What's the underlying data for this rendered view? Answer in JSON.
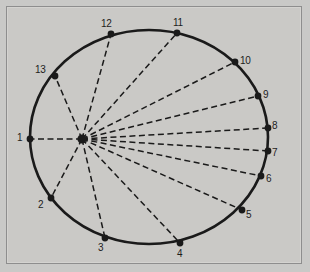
{
  "figure": {
    "type": "circle-spoke-diagram",
    "background_color": "#c9c9c7",
    "panel_color": "#cac9c6",
    "frame_color": "#8e8e8e",
    "stroke_color": "#1a1a1a",
    "circle": {
      "center_x": 149,
      "center_y": 137,
      "radius_x": 119,
      "radius_y": 107,
      "line_width": 2.6
    },
    "hub": {
      "label": "hub",
      "x": 82,
      "y": 139,
      "radius": 4.6
    },
    "spoke_style": {
      "dash": "6,3.5",
      "width": 1.5
    }
  },
  "chart_data": {
    "type": "scatter",
    "title": "",
    "xlabel": "",
    "ylabel": "",
    "grid": false,
    "legend": null,
    "annotations": [],
    "hub": {
      "x": 82,
      "y": 139
    },
    "nodes": [
      {
        "label": "1",
        "x": 30,
        "y": 139,
        "label_x": 17,
        "label_y": 133
      },
      {
        "label": "2",
        "x": 51,
        "y": 198,
        "label_x": 38,
        "label_y": 200
      },
      {
        "label": "3",
        "x": 105,
        "y": 238,
        "label_x": 98,
        "label_y": 243
      },
      {
        "label": "4",
        "x": 180,
        "y": 243,
        "label_x": 177,
        "label_y": 249
      },
      {
        "label": "5",
        "x": 242,
        "y": 210,
        "label_x": 246,
        "label_y": 210
      },
      {
        "label": "6",
        "x": 261,
        "y": 176,
        "label_x": 266,
        "label_y": 174
      },
      {
        "label": "7",
        "x": 268,
        "y": 151,
        "label_x": 272,
        "label_y": 148
      },
      {
        "label": "8",
        "x": 268,
        "y": 128,
        "label_x": 272,
        "label_y": 121
      },
      {
        "label": "9",
        "x": 258,
        "y": 96,
        "label_x": 263,
        "label_y": 90
      },
      {
        "label": "10",
        "x": 235,
        "y": 62,
        "label_x": 240,
        "label_y": 56
      },
      {
        "label": "11",
        "x": 177,
        "y": 33,
        "label_x": 173,
        "label_y": 18
      },
      {
        "label": "12",
        "x": 111,
        "y": 34,
        "label_x": 101,
        "label_y": 19
      },
      {
        "label": "13",
        "x": 55,
        "y": 76,
        "label_x": 35,
        "label_y": 65
      }
    ]
  }
}
